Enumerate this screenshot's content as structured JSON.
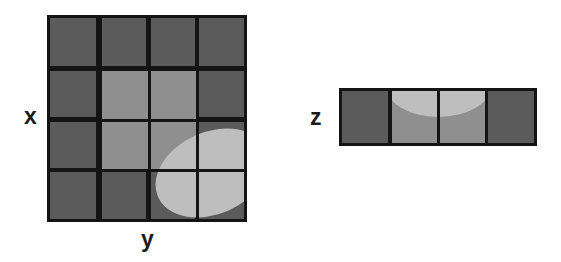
{
  "figure": {
    "type": "schematic-diagram",
    "background_color": "#ffffff",
    "colors": {
      "cell_dark": "#5b5b5b",
      "cell_lit": "#8f8f8f",
      "region_bright": "#bebebe",
      "gridline": "#141414",
      "label_text": "#1c1c1c"
    }
  },
  "labels": {
    "x": "x",
    "y": "y",
    "z": "z"
  },
  "panel_xy": {
    "name": "x-y grid panel",
    "columns": 4,
    "rows": 4,
    "cells": [
      [
        {
          "id": "xy-r1c1",
          "state": "dark"
        },
        {
          "id": "xy-r1c2",
          "state": "dark"
        },
        {
          "id": "xy-r1c3",
          "state": "dark"
        },
        {
          "id": "xy-r1c4",
          "state": "dark"
        }
      ],
      [
        {
          "id": "xy-r2c1",
          "state": "dark"
        },
        {
          "id": "xy-r2c2",
          "state": "lit"
        },
        {
          "id": "xy-r2c3",
          "state": "lit"
        },
        {
          "id": "xy-r2c4",
          "state": "dark"
        }
      ],
      [
        {
          "id": "xy-r3c1",
          "state": "dark"
        },
        {
          "id": "xy-r3c2",
          "state": "lit"
        },
        {
          "id": "xy-r3c3",
          "state": "lit"
        },
        {
          "id": "xy-r3c4",
          "state": "dark"
        }
      ],
      [
        {
          "id": "xy-r4c1",
          "state": "dark"
        },
        {
          "id": "xy-r4c2",
          "state": "dark"
        },
        {
          "id": "xy-r4c3",
          "state": "dark"
        },
        {
          "id": "xy-r4c4",
          "state": "dark"
        }
      ]
    ],
    "overlay_shape": {
      "id": "xy-ellipse",
      "shape": "ellipse",
      "rotation_deg": -24,
      "fill": "#bebebe"
    }
  },
  "panel_z": {
    "name": "z strip panel",
    "columns": 4,
    "rows": 1,
    "cells": [
      {
        "id": "z-c1",
        "state": "dark"
      },
      {
        "id": "z-c2",
        "state": "lit"
      },
      {
        "id": "z-c3",
        "state": "lit"
      },
      {
        "id": "z-c4",
        "state": "dark"
      }
    ],
    "overlay_shape": {
      "id": "z-cap",
      "shape": "curved-cap",
      "fill": "#bebebe"
    }
  }
}
